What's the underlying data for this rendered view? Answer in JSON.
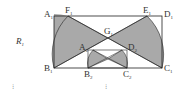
{
  "figure": {
    "region_label": {
      "main": "R",
      "sub": "1"
    },
    "outer_rect": {
      "A": {
        "main": "A",
        "sub": "1"
      },
      "B": {
        "main": "B",
        "sub": "1"
      },
      "C": {
        "main": "C",
        "sub": "1"
      },
      "D": {
        "main": "D",
        "sub": "1"
      },
      "E": {
        "main": "E",
        "sub": "1"
      },
      "F": {
        "main": "F",
        "sub": "1"
      },
      "G": {
        "main": "G",
        "sub": "1"
      }
    },
    "inner_rect": {
      "A": {
        "main": "A",
        "sub": "2"
      },
      "B": {
        "main": "B",
        "sub": "2"
      },
      "C": {
        "main": "C",
        "sub": "2"
      },
      "D": {
        "main": "D",
        "sub": "2"
      }
    },
    "footer_marks": [
      "⁝",
      "⁝"
    ],
    "colors": {
      "fill": "#a9a9a9",
      "stroke": "#222222",
      "background": "#ffffff"
    }
  }
}
